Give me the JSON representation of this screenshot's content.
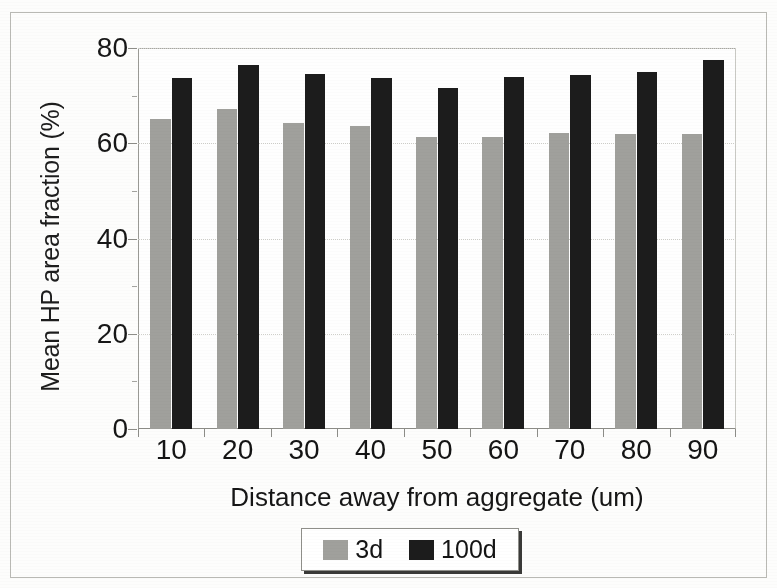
{
  "figure": {
    "frame_visible": true,
    "background_color": "#fdfdfc"
  },
  "chart_data": {
    "type": "bar",
    "title": "",
    "subtitle": "",
    "xlabel": "Distance away from aggregate (um)",
    "ylabel": "Mean HP area fraction (%)",
    "categories": [
      "10",
      "20",
      "30",
      "40",
      "50",
      "60",
      "70",
      "80",
      "90"
    ],
    "series": [
      {
        "name": "3d",
        "color": "#a0a09c",
        "values": [
          65.0,
          67.2,
          64.2,
          63.6,
          61.4,
          61.4,
          62.2,
          62.0,
          62.0
        ]
      },
      {
        "name": "100d",
        "color": "#1c1c1c",
        "values": [
          73.6,
          76.5,
          74.6,
          73.6,
          71.6,
          73.9,
          74.4,
          74.9,
          77.4
        ]
      }
    ],
    "ylim": [
      0,
      80
    ],
    "ytick_values": [
      0,
      20,
      40,
      60,
      80
    ],
    "ytick_labels": [
      "0",
      "20",
      "40",
      "60",
      "80"
    ],
    "y_minor_tick_values": [
      10,
      30,
      50,
      70
    ],
    "xtick_labels": [
      "10",
      "20",
      "30",
      "40",
      "50",
      "60",
      "70",
      "80",
      "90"
    ],
    "grid": "horizontal-dotted",
    "legend_position": "below-plot-center",
    "legend_entries": [
      {
        "label": "3d",
        "color": "#a0a09c",
        "swatch": "filled-square"
      },
      {
        "label": "100d",
        "color": "#1c1c1c",
        "swatch": "filled-square"
      }
    ],
    "axis_colors": {
      "axis_line": "#8d8d88",
      "gridline": "#cfcfca",
      "text": "#161616"
    }
  }
}
